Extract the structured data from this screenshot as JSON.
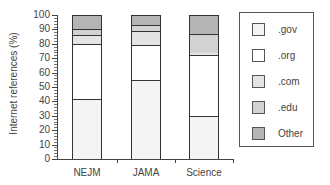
{
  "chart_data": {
    "type": "bar",
    "stacked": true,
    "title": "",
    "xlabel": "",
    "ylabel": "Internet references (%)",
    "ylim": [
      0,
      100
    ],
    "yticks": [
      0,
      10,
      20,
      30,
      40,
      50,
      60,
      70,
      80,
      90,
      100
    ],
    "categories": [
      "NEJM",
      "JAMA",
      "Science"
    ],
    "series": [
      {
        "name": ".gov",
        "color": "#f4f4f4",
        "values": [
          42,
          55,
          30
        ]
      },
      {
        "name": ".org",
        "color": "#ffffff",
        "values": [
          38,
          24,
          42
        ]
      },
      {
        "name": ".com",
        "color": "#e4e4e4",
        "values": [
          6,
          10,
          2
        ]
      },
      {
        "name": ".edu",
        "color": "#d2d2d2",
        "values": [
          4,
          4,
          13
        ]
      },
      {
        "name": "Other",
        "color": "#b5b5b5",
        "values": [
          10,
          7,
          13
        ]
      }
    ],
    "legend_position": "right",
    "grid": false
  },
  "axis": {
    "ylabel": "Internet references (%)",
    "yticklabels": [
      "0",
      "10",
      "20",
      "30",
      "40",
      "50",
      "60",
      "70",
      "80",
      "90",
      "100"
    ],
    "xticklabels": [
      "NEJM",
      "JAMA",
      "Science"
    ]
  },
  "legend": {
    "items": [
      ".gov",
      ".org",
      ".com",
      ".edu",
      "Other"
    ]
  }
}
